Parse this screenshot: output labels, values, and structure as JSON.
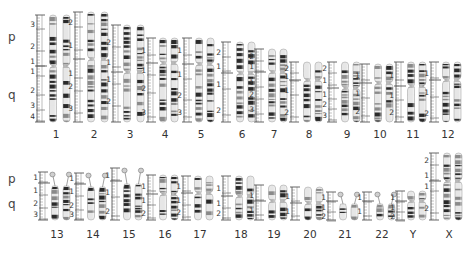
{
  "diagram": {
    "type": "human karyotype ideogram",
    "arm_labels": {
      "p": "p",
      "q": "q"
    },
    "colors": {
      "dark_band": "#2a2a2a",
      "mid_band": "#8a8a8a",
      "light_band": "#e6e6e6",
      "ruler": "#555555",
      "centromere": "#b8b8b8"
    },
    "rows": [
      {
        "arm_label_y": {
          "p": 30,
          "q": 98
        },
        "label_y": 128,
        "bottom": 122,
        "chromosomes": [
          {
            "name": "1",
            "x": 56,
            "ruler_x": 37,
            "top": 15,
            "cent": 66,
            "bottom": 122,
            "ruler_labels": [
              {
                "t": "3",
                "y": 24
              },
              {
                "t": "2",
                "y": 46
              },
              {
                "t": "1",
                "y": 61
              },
              {
                "t": "1",
                "y": 71
              },
              {
                "t": "2",
                "y": 90
              },
              {
                "t": "3",
                "y": 105
              },
              {
                "t": "4",
                "y": 116
              }
            ]
          },
          {
            "name": "2",
            "x": 94,
            "ruler_x": 75,
            "top": 12,
            "cent": 59,
            "bottom": 122,
            "ruler_labels": [
              {
                "t": "2",
                "y": 22
              },
              {
                "t": "1",
                "y": 45
              },
              {
                "t": "1",
                "y": 73
              },
              {
                "t": "2",
                "y": 86
              },
              {
                "t": "3",
                "y": 108
              }
            ]
          },
          {
            "name": "3",
            "x": 130,
            "ruler_x": 113,
            "top": 25,
            "cent": 72,
            "bottom": 122,
            "ruler_labels": [
              {
                "t": "2",
                "y": 42
              },
              {
                "t": "1",
                "y": 62
              },
              {
                "t": "1",
                "y": 79
              },
              {
                "t": "2",
                "y": 101
              }
            ]
          },
          {
            "name": "4",
            "x": 165,
            "ruler_x": 148,
            "top": 38,
            "cent": 63,
            "bottom": 122,
            "ruler_labels": [
              {
                "t": "1",
                "y": 50
              },
              {
                "t": "1",
                "y": 70
              },
              {
                "t": "2",
                "y": 88
              },
              {
                "t": "3",
                "y": 112
              }
            ]
          },
          {
            "name": "5",
            "x": 201,
            "ruler_x": 184,
            "top": 38,
            "cent": 64,
            "bottom": 122,
            "ruler_labels": [
              {
                "t": "1",
                "y": 50
              },
              {
                "t": "1",
                "y": 74
              },
              {
                "t": "2",
                "y": 95
              },
              {
                "t": "3",
                "y": 112
              }
            ]
          },
          {
            "name": "6",
            "x": 242,
            "ruler_x": 223,
            "top": 42,
            "cent": 73,
            "bottom": 122,
            "ruler_labels": [
              {
                "t": "2",
                "y": 52
              },
              {
                "t": "1",
                "y": 66
              },
              {
                "t": "1",
                "y": 84
              },
              {
                "t": "2",
                "y": 110
              }
            ]
          },
          {
            "name": "7",
            "x": 274,
            "ruler_x": 256,
            "top": 49,
            "cent": 72,
            "bottom": 122,
            "ruler_labels": [
              {
                "t": "2",
                "y": 56
              },
              {
                "t": "1",
                "y": 66
              },
              {
                "t": "1",
                "y": 82
              },
              {
                "t": "2",
                "y": 94
              },
              {
                "t": "3",
                "y": 109
              }
            ]
          },
          {
            "name": "8",
            "x": 309,
            "ruler_x": 291,
            "top": 62,
            "cent": 80,
            "bottom": 122,
            "ruler_labels": [
              {
                "t": "2",
                "y": 68
              },
              {
                "t": "1",
                "y": 76
              },
              {
                "t": "1",
                "y": 90
              },
              {
                "t": "2",
                "y": 112
              }
            ]
          },
          {
            "name": "9",
            "x": 347,
            "ruler_x": 329,
            "top": 62,
            "cent": 88,
            "bottom": 122,
            "ruler_labels": [
              {
                "t": "2",
                "y": 68
              },
              {
                "t": "1",
                "y": 80
              },
              {
                "t": "1",
                "y": 94
              },
              {
                "t": "2",
                "y": 104
              },
              {
                "t": "3",
                "y": 115
              }
            ]
          },
          {
            "name": "10",
            "x": 380,
            "ruler_x": 362,
            "top": 64,
            "cent": 83,
            "bottom": 122,
            "ruler_labels": [
              {
                "t": "1",
                "y": 75
              },
              {
                "t": "1",
                "y": 93
              },
              {
                "t": "2",
                "y": 111
              }
            ]
          },
          {
            "name": "11",
            "x": 413,
            "ruler_x": 396,
            "top": 62,
            "cent": 86,
            "bottom": 122,
            "ruler_labels": [
              {
                "t": "1",
                "y": 75
              },
              {
                "t": "1",
                "y": 95
              },
              {
                "t": "2",
                "y": 112
              }
            ]
          },
          {
            "name": "12",
            "x": 448,
            "ruler_x": 431,
            "top": 62,
            "cent": 80,
            "bottom": 122,
            "ruler_labels": [
              {
                "t": "1",
                "y": 73
              },
              {
                "t": "1",
                "y": 92
              },
              {
                "t": "2",
                "y": 113
              }
            ]
          }
        ]
      },
      {
        "arm_label_y": {
          "p": 177,
          "q": 205
        },
        "label_y": 228,
        "bottom": 220,
        "chromosomes": [
          {
            "name": "13",
            "x": 57,
            "ruler_x": 40,
            "top": 172,
            "cent": 183,
            "bottom": 220,
            "acrocentric": true,
            "ruler_labels": [
              {
                "t": "1",
                "y": 177
              },
              {
                "t": "1",
                "y": 190
              },
              {
                "t": "2",
                "y": 203
              },
              {
                "t": "3",
                "y": 214
              }
            ]
          },
          {
            "name": "14",
            "x": 93,
            "ruler_x": 76,
            "top": 173,
            "cent": 184,
            "bottom": 220,
            "acrocentric": true,
            "ruler_labels": [
              {
                "t": "1",
                "y": 178
              },
              {
                "t": "1",
                "y": 191
              },
              {
                "t": "2",
                "y": 205
              },
              {
                "t": "3",
                "y": 214
              }
            ]
          },
          {
            "name": "15",
            "x": 129,
            "ruler_x": 112,
            "top": 168,
            "cent": 181,
            "bottom": 220,
            "acrocentric": true,
            "ruler_labels": [
              {
                "t": "1",
                "y": 175
              },
              {
                "t": "1",
                "y": 192
              },
              {
                "t": "2",
                "y": 211
              }
            ]
          },
          {
            "name": "16",
            "x": 165,
            "ruler_x": 148,
            "top": 175,
            "cent": 194,
            "bottom": 220,
            "ruler_labels": [
              {
                "t": "1",
                "y": 186
              },
              {
                "t": "1",
                "y": 200
              },
              {
                "t": "2",
                "y": 213
              }
            ]
          },
          {
            "name": "17",
            "x": 200,
            "ruler_x": 183,
            "top": 176,
            "cent": 193,
            "bottom": 220,
            "ruler_labels": [
              {
                "t": "1",
                "y": 186
              },
              {
                "t": "1",
                "y": 200
              },
              {
                "t": "2",
                "y": 212
              }
            ]
          },
          {
            "name": "18",
            "x": 241,
            "ruler_x": 223,
            "top": 176,
            "cent": 196,
            "bottom": 220,
            "ruler_labels": [
              {
                "t": "1",
                "y": 188
              },
              {
                "t": "1",
                "y": 203
              },
              {
                "t": "2",
                "y": 213
              }
            ]
          },
          {
            "name": "19",
            "x": 274,
            "ruler_x": 256,
            "top": 185,
            "cent": 201,
            "bottom": 220,
            "ruler_labels": [
              {
                "t": "1",
                "y": 195
              },
              {
                "t": "1",
                "y": 210
              }
            ]
          },
          {
            "name": "20",
            "x": 310,
            "ruler_x": 292,
            "top": 187,
            "cent": 203,
            "bottom": 220,
            "ruler_labels": [
              {
                "t": "1",
                "y": 196
              },
              {
                "t": "1",
                "y": 211
              }
            ]
          },
          {
            "name": "21",
            "x": 345,
            "ruler_x": 328,
            "top": 192,
            "cent": 201,
            "bottom": 220,
            "acrocentric": true,
            "ruler_labels": [
              {
                "t": "1",
                "y": 197
              },
              {
                "t": "1",
                "y": 207
              },
              {
                "t": "2",
                "y": 216
              }
            ]
          },
          {
            "name": "22",
            "x": 382,
            "ruler_x": 364,
            "top": 192,
            "cent": 201,
            "bottom": 220,
            "acrocentric": true,
            "ruler_labels": [
              {
                "t": "1",
                "y": 197
              },
              {
                "t": "1",
                "y": 211
              }
            ]
          },
          {
            "name": "Y",
            "x": 413,
            "ruler_x": 397,
            "top": 191,
            "cent": 201,
            "bottom": 220,
            "ruler_labels": [
              {
                "t": "1",
                "y": 197
              },
              {
                "t": "1",
                "y": 207
              },
              {
                "t": "2",
                "y": 216
              }
            ]
          },
          {
            "name": "X",
            "x": 449,
            "ruler_x": 431,
            "top": 153,
            "cent": 181,
            "bottom": 220,
            "ruler_labels": [
              {
                "t": "2",
                "y": 160
              },
              {
                "t": "1",
                "y": 175
              },
              {
                "t": "1",
                "y": 186
              },
              {
                "t": "2",
                "y": 208
              }
            ]
          }
        ]
      }
    ]
  }
}
